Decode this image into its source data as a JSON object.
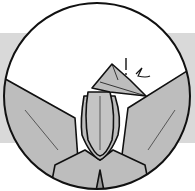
{
  "diagram": {
    "type": "origami-step",
    "callout": {
      "arrow_symbol": "crimp/reverse fold indicator",
      "mark": "!"
    },
    "colors": {
      "paper": "#bdbdbd",
      "background_band": "#d9d9d9",
      "line": "#111111",
      "circle_fill": "#ffffff"
    }
  }
}
